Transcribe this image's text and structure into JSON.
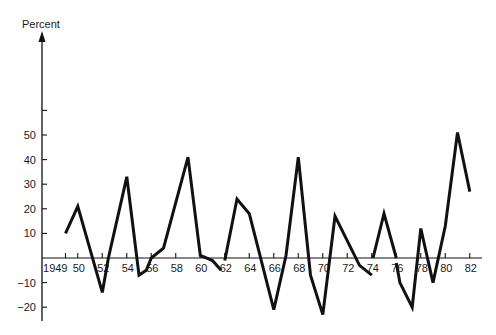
{
  "chart_data": {
    "type": "line",
    "title": "",
    "xlabel": "",
    "ylabel": "Percent",
    "ylim": [
      -25,
      60
    ],
    "xlim": [
      1949,
      1982
    ],
    "grid": false,
    "legend": null,
    "y_ticks": [
      -20,
      -10,
      10,
      20,
      30,
      40,
      50,
      60
    ],
    "y_tick_labels": [
      "-20",
      "-10",
      "10",
      "20",
      "30",
      "40",
      "50",
      ""
    ],
    "x_ticks": [
      1949,
      1950,
      1952,
      1954,
      1956,
      1958,
      1960,
      1962,
      1964,
      1966,
      1968,
      1970,
      1972,
      1974,
      1976,
      1978,
      1980,
      1982
    ],
    "x_tick_labels": [
      "1949",
      "50",
      "52",
      "54",
      "56",
      "58",
      "60",
      "62",
      "64",
      "66",
      "68",
      "70",
      "72",
      "74",
      "76",
      "78",
      "80",
      "82"
    ],
    "series": [
      {
        "name": "Percent change",
        "segments": [
          {
            "x": [
              1949,
              1950,
              1952,
              1952.5,
              1954,
              1955,
              1955.6,
              1956,
              1957,
              1959,
              1960,
              1961,
              1961.7
            ],
            "y": [
              10,
              21,
              -14,
              0,
              33,
              -7,
              -5,
              0,
              4,
              41,
              1,
              -1,
              -5
            ]
          },
          {
            "x": [
              1962,
              1963,
              1964,
              1966,
              1967,
              1968,
              1969,
              1970,
              1971,
              1973,
              1974
            ],
            "y": [
              -1,
              24,
              18,
              -21,
              1,
              41,
              -7,
              -23,
              17,
              -3,
              -7
            ]
          },
          {
            "x": [
              1974.1,
              1975,
              1976
            ],
            "y": [
              0,
              18,
              0
            ]
          },
          {
            "x": [
              1976,
              1976.3,
              1977.3,
              1978,
              1979,
              1980,
              1981,
              1982
            ],
            "y": [
              -2,
              -10,
              -20,
              12,
              -10,
              13,
              51,
              27
            ]
          }
        ]
      }
    ]
  },
  "axis": {
    "y_title": "Percent"
  }
}
